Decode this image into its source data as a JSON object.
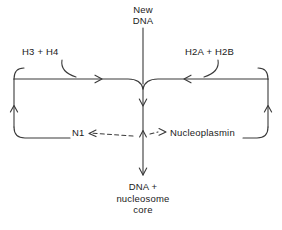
{
  "diagram": {
    "stroke_color": "#3a3a3a",
    "text_color": "#1a1a1a",
    "background_color": "#ffffff",
    "labels": {
      "new_dna": "New\nDNA",
      "h3_h4": "H3 + H4",
      "h2a_h2b": "H2A + H2B",
      "n1": "N1",
      "nucleoplasmin": "Nucleoplasmin",
      "product": "DNA +\nnucleosome\ncore"
    },
    "nodes": [
      {
        "id": "new-dna",
        "label": "New DNA",
        "role": "input"
      },
      {
        "id": "h3-h4",
        "label": "H3 + H4",
        "role": "reactant"
      },
      {
        "id": "h2a-h2b",
        "label": "H2A + H2B",
        "role": "reactant"
      },
      {
        "id": "n1",
        "label": "N1",
        "role": "chaperone"
      },
      {
        "id": "nucleoplasmin",
        "label": "Nucleoplasmin",
        "role": "chaperone"
      },
      {
        "id": "product",
        "label": "DNA + nucleosome core",
        "role": "product"
      }
    ],
    "edges": [
      {
        "from": "new-dna",
        "to": "assembly-junction",
        "style": "solid",
        "direction": "down"
      },
      {
        "from": "h3-h4",
        "to": "assembly-junction",
        "style": "solid",
        "direction": "right"
      },
      {
        "from": "h2a-h2b",
        "to": "assembly-junction",
        "style": "solid",
        "direction": "left"
      },
      {
        "from": "assembly-junction",
        "to": "product",
        "style": "solid",
        "direction": "down"
      },
      {
        "from": "assembly-junction",
        "to": "n1",
        "style": "dashed",
        "direction": "left"
      },
      {
        "from": "assembly-junction",
        "to": "nucleoplasmin",
        "style": "dashed",
        "direction": "right"
      },
      {
        "from": "n1",
        "to": "h3-h4",
        "style": "solid",
        "direction": "recycle-left-loop"
      },
      {
        "from": "nucleoplasmin",
        "to": "h2a-h2b",
        "style": "solid",
        "direction": "recycle-right-loop"
      }
    ]
  }
}
